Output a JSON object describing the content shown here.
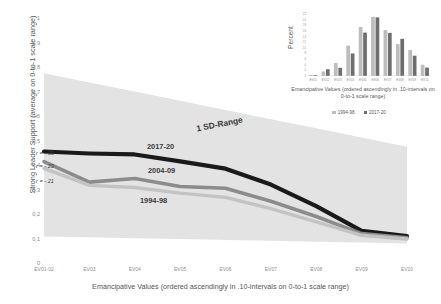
{
  "chart_data": {
    "type": "line",
    "title": "",
    "xlabel": "Emancipative Values (ordered ascendingly in .10-intervals on 0-to-1 scale range)",
    "ylabel": "Strong Leader Support (average on 0-to-1 scale range)",
    "ylim": [
      0,
      1
    ],
    "ytick_labels": [
      "1",
      "0,9",
      "0,8",
      "0,7",
      "0,6",
      "0,5",
      "0,4",
      "0,3",
      "0,2",
      "0,1",
      "0"
    ],
    "ytick_values": [
      1,
      0.9,
      0.8,
      0.7,
      0.6,
      0.5,
      0.4,
      0.3,
      0.2,
      0.1,
      0
    ],
    "categories": [
      "EV01-02",
      "EV03",
      "EV04",
      "EV05",
      "EV06",
      "EV07",
      "EV08",
      "EV09",
      "EV10"
    ],
    "grid": false,
    "legend_position": "inline-annotations",
    "series": [
      {
        "name": "2017-20",
        "color": "#1a1a1a",
        "r": "r = -.33",
        "values": [
          0.455,
          0.447,
          0.443,
          0.415,
          0.385,
          0.32,
          0.232,
          0.131,
          0.11
        ]
      },
      {
        "name": "2004-09",
        "color": "#8c8c8c",
        "r": "r = -.23",
        "values": [
          0.414,
          0.33,
          0.345,
          0.312,
          0.305,
          0.252,
          0.19,
          0.12,
          0.103
        ]
      },
      {
        "name": "1994-98",
        "color": "#c3c3c3",
        "r": "r = -.21",
        "values": [
          0.386,
          0.317,
          0.308,
          0.285,
          0.268,
          0.222,
          0.168,
          0.113,
          0.098
        ]
      }
    ],
    "band": {
      "label": "1 SD-Range",
      "color": "#e3e3e3",
      "upper": [
        0.775,
        0.737,
        0.7,
        0.662,
        0.625,
        0.587,
        0.55,
        0.512,
        0.475
      ],
      "lower": [
        0.108,
        0.105,
        0.101,
        0.098,
        0.094,
        0.091,
        0.087,
        0.084,
        0.08
      ]
    }
  },
  "inset_chart": {
    "type": "bar",
    "title": "",
    "ylabel": "Percent",
    "xlabel": "Emancipative Values (ordered ascendingly in .10-intervals on 0-to-1 scale range)",
    "ytick_labels": [
      "22",
      "20",
      "18",
      "16",
      "14",
      "12",
      "10",
      "8",
      "6",
      "4",
      "2",
      "0"
    ],
    "ylim": [
      0,
      22
    ],
    "categories": [
      "EV01",
      "EV02",
      "EV03",
      "EV04",
      "EV05",
      "EV06",
      "EV07",
      "EV08",
      "EV09",
      "EV10"
    ],
    "series": [
      {
        "name": "1994-98",
        "color": "#bdbdbd",
        "values": [
          0.4,
          1.6,
          4.6,
          10.8,
          17.4,
          21.0,
          16.3,
          11.3,
          9.2,
          4.0
        ]
      },
      {
        "name": "2017-20",
        "color": "#6e6e6e",
        "values": [
          0.3,
          2.4,
          2.9,
          8.0,
          15.4,
          20.8,
          15.3,
          13.2,
          7.2,
          3.0
        ]
      }
    ],
    "legend": [
      {
        "label": "1994-98",
        "color": "#bdbdbd"
      },
      {
        "label": "2017-20",
        "color": "#6e6e6e"
      }
    ]
  }
}
